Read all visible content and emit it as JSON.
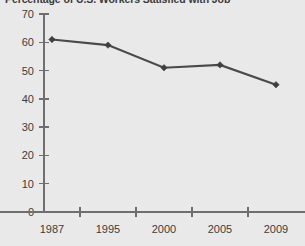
{
  "chart_data": {
    "type": "line",
    "title": "Percentage of U.S. Workers Satisfied with Job",
    "xlabel": "",
    "ylabel": "",
    "categories": [
      "1987",
      "1995",
      "2000",
      "2005",
      "2009"
    ],
    "x": [
      1987,
      1995,
      2000,
      2005,
      2009
    ],
    "values": [
      61,
      59,
      51,
      52,
      45
    ],
    "series": [
      {
        "name": "Percentage satisfied",
        "values": [
          61,
          59,
          51,
          52,
          45
        ],
        "color": "#4a4a4a",
        "marker": "diamond"
      }
    ],
    "ylim": [
      0,
      70
    ],
    "y_ticks": [
      0,
      10,
      20,
      30,
      40,
      50,
      60,
      70
    ],
    "y_tick_labels": [
      "0",
      "10",
      "20",
      "30",
      "40",
      "50",
      "60",
      "70"
    ],
    "x_tick_labels": [
      "1987",
      "1995",
      "2000",
      "2005",
      "2009"
    ],
    "grid": false,
    "legend": false,
    "legend_position": "none",
    "background_color": "#e9e9e9",
    "axis_color": "#6e6e6e",
    "text_color": "#3d3d3d"
  },
  "layout": {
    "plot_left": 44,
    "plot_right": 300,
    "plot_top": 14,
    "plot_bottom": 212,
    "point_x_positions": [
      52,
      108,
      164,
      220,
      276
    ]
  }
}
